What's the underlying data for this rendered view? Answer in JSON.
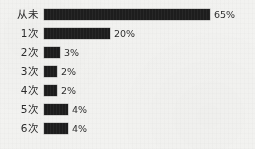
{
  "chart_data": {
    "type": "bar",
    "orientation": "horizontal",
    "title": "",
    "subtitle": "",
    "xlabel": "",
    "ylabel": "",
    "grid": false,
    "legend": null,
    "xlim": [
      0,
      65
    ],
    "categories": [
      "从未",
      "1次",
      "2次",
      "3次",
      "4次",
      "5次",
      "6次"
    ],
    "values": [
      65,
      20,
      3,
      2,
      2,
      4,
      4
    ],
    "value_labels": [
      "65%",
      "20%",
      "3%",
      "2%",
      "2%",
      "4%",
      "4%"
    ],
    "bar_pixel_widths": [
      166,
      66,
      16,
      13,
      13,
      24,
      24
    ],
    "bar_color": "#1d1d1d",
    "background_color": "#f3f3f1",
    "text_color": "#2b2b2b",
    "rows": [
      {
        "label": "从未",
        "value": 65,
        "value_label": "65%",
        "bar_width_px": 166
      },
      {
        "label": "1次",
        "value": 20,
        "value_label": "20%",
        "bar_width_px": 66
      },
      {
        "label": "2次",
        "value": 3,
        "value_label": "3%",
        "bar_width_px": 16
      },
      {
        "label": "3次",
        "value": 2,
        "value_label": "2%",
        "bar_width_px": 13
      },
      {
        "label": "4次",
        "value": 2,
        "value_label": "2%",
        "bar_width_px": 13
      },
      {
        "label": "5次",
        "value": 4,
        "value_label": "4%",
        "bar_width_px": 24
      },
      {
        "label": "6次",
        "value": 4,
        "value_label": "4%",
        "bar_width_px": 24
      }
    ]
  }
}
